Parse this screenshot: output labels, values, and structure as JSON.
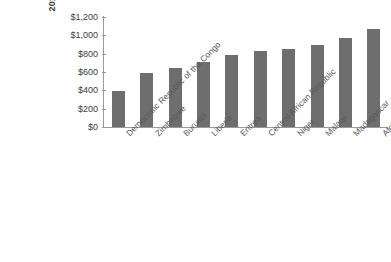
{
  "chart_data": {
    "type": "bar",
    "title": "",
    "xlabel": "",
    "ylabel": "2013 U.S. Dollars",
    "ylim": [
      0,
      1200
    ],
    "ytick_values": [
      1200,
      1000,
      800,
      600,
      400,
      200,
      0
    ],
    "ytick_labels": [
      "$1,200",
      "$1,000",
      "$800",
      "$600",
      "$400",
      "$200",
      "$0"
    ],
    "grid": false,
    "legend": "none",
    "bar_color": "#6e6e6e",
    "categories": [
      "Democratic Republic of the Congo",
      "Zimbabwe",
      "Burundi",
      "Liberia",
      "Eritrea",
      "Central African Republic",
      "Niger",
      "Malawi",
      "Madagascar",
      "Afghanistan"
    ],
    "values": [
      390,
      590,
      645,
      710,
      790,
      825,
      850,
      890,
      970,
      1070
    ]
  }
}
